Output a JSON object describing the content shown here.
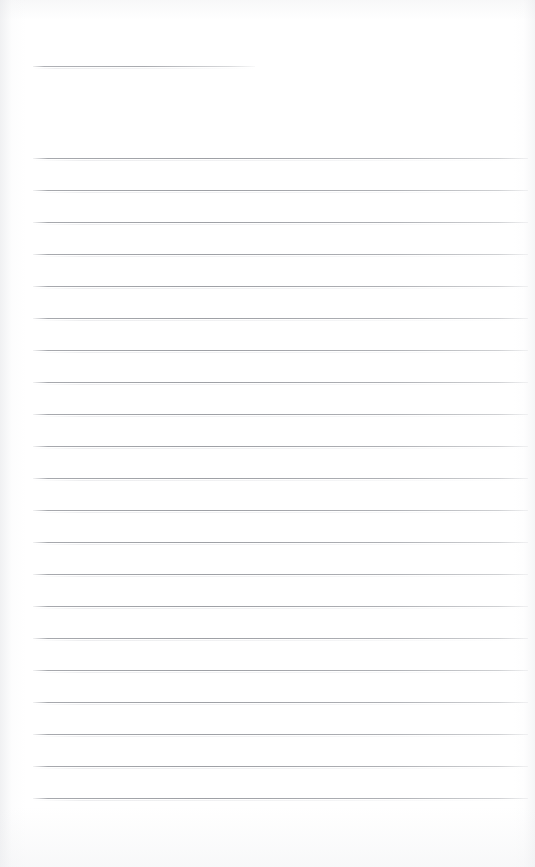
{
  "document": {
    "kind": "ruled-notepad-page",
    "title_line_label": "title-rule",
    "body_line_label": "writing-rule",
    "page_width": 535,
    "page_height": 867,
    "background_color": "#ffffff",
    "rule_color": "#a2a4a9",
    "rule_thickness_px": 1,
    "rule_spacing_px": 32,
    "left_margin_px": 33,
    "right_margin_px": 528,
    "visible_text": "",
    "total_rules": 22
  },
  "title_rule": {
    "name": "title-rule",
    "y": 66,
    "x_start": 33,
    "x_end": 255,
    "width": 222
  },
  "body_rules": [
    {
      "index": 1,
      "y": 158,
      "x_start": 33,
      "x_end": 528
    },
    {
      "index": 2,
      "y": 190,
      "x_start": 33,
      "x_end": 528
    },
    {
      "index": 3,
      "y": 222,
      "x_start": 33,
      "x_end": 528
    },
    {
      "index": 4,
      "y": 254,
      "x_start": 33,
      "x_end": 528
    },
    {
      "index": 5,
      "y": 286,
      "x_start": 33,
      "x_end": 528
    },
    {
      "index": 6,
      "y": 318,
      "x_start": 33,
      "x_end": 528
    },
    {
      "index": 7,
      "y": 350,
      "x_start": 33,
      "x_end": 528
    },
    {
      "index": 8,
      "y": 382,
      "x_start": 33,
      "x_end": 528
    },
    {
      "index": 9,
      "y": 414,
      "x_start": 33,
      "x_end": 528
    },
    {
      "index": 10,
      "y": 446,
      "x_start": 33,
      "x_end": 528
    },
    {
      "index": 11,
      "y": 478,
      "x_start": 33,
      "x_end": 528
    },
    {
      "index": 12,
      "y": 510,
      "x_start": 33,
      "x_end": 528
    },
    {
      "index": 13,
      "y": 542,
      "x_start": 33,
      "x_end": 528
    },
    {
      "index": 14,
      "y": 574,
      "x_start": 33,
      "x_end": 528
    },
    {
      "index": 15,
      "y": 606,
      "x_start": 33,
      "x_end": 528
    },
    {
      "index": 16,
      "y": 638,
      "x_start": 33,
      "x_end": 528
    },
    {
      "index": 17,
      "y": 670,
      "x_start": 33,
      "x_end": 528
    },
    {
      "index": 18,
      "y": 702,
      "x_start": 33,
      "x_end": 528
    },
    {
      "index": 19,
      "y": 734,
      "x_start": 33,
      "x_end": 528
    },
    {
      "index": 20,
      "y": 766,
      "x_start": 33,
      "x_end": 528
    },
    {
      "index": 21,
      "y": 798,
      "x_start": 33,
      "x_end": 528
    }
  ]
}
